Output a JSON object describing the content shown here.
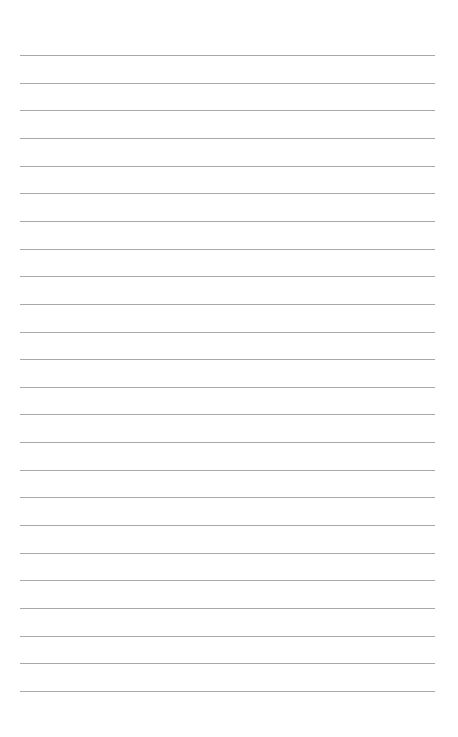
{
  "page": {
    "type": "lined-paper",
    "background_color": "#ffffff",
    "line_color": "#a8a8a8",
    "line_count": 24,
    "first_line_y": 55,
    "line_spacing": 27.65,
    "line_left": 20,
    "line_width": 415
  }
}
